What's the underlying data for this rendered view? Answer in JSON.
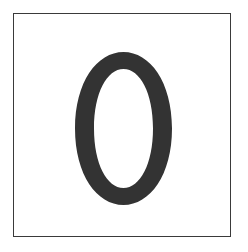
{
  "tile": {
    "digit": "0",
    "digit_color": "#333333",
    "border_color": "#3a3a3a",
    "background_color": "#ffffff"
  }
}
